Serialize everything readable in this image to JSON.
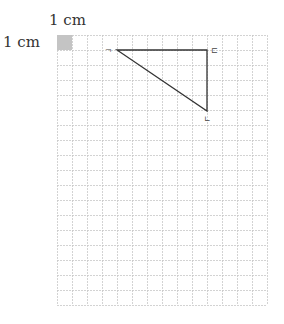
{
  "labels": {
    "top": "1 cm",
    "left": "1 cm"
  },
  "grid": {
    "x0": 57,
    "y0": 35,
    "cols": 14,
    "rows": 18,
    "cell": 15,
    "line_color": "#c8c8c8",
    "unit_square_color": "#c4c4c4"
  },
  "triangle": {
    "vertices": [
      [
        117,
        50
      ],
      [
        207,
        50
      ],
      [
        207,
        111
      ]
    ],
    "stroke": "#333333",
    "vertex_labels": [
      "¬",
      "⊏",
      "∟"
    ]
  }
}
